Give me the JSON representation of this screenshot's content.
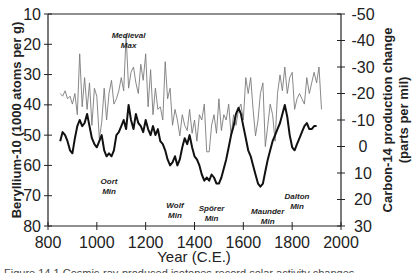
{
  "chart_data": {
    "type": "line",
    "title": "",
    "xlabel": "Year (C.E.)",
    "ylabel": "Beryllium-10 (1000 atoms per g)",
    "y2label_line1": "Carbon-14 production change",
    "y2label_line2": "(parts per mil)",
    "xlim": [
      800,
      2000
    ],
    "ylim": [
      80,
      10
    ],
    "y2lim": [
      30,
      -50
    ],
    "x_ticks": [
      800,
      1000,
      1200,
      1400,
      1600,
      1800,
      2000
    ],
    "y_ticks": [
      10,
      20,
      30,
      40,
      50,
      60,
      70,
      80
    ],
    "y2_ticks": [
      -50,
      -40,
      -30,
      -20,
      -10,
      0,
      10,
      20,
      30
    ],
    "grid": false,
    "legend": "none",
    "series": [
      {
        "name": "Beryllium-10",
        "axis": "left",
        "style": "thick black",
        "x": [
          850,
          860,
          870,
          880,
          890,
          900,
          910,
          920,
          930,
          940,
          950,
          960,
          970,
          980,
          990,
          1000,
          1010,
          1020,
          1030,
          1040,
          1050,
          1060,
          1070,
          1080,
          1090,
          1100,
          1110,
          1120,
          1130,
          1140,
          1150,
          1160,
          1170,
          1180,
          1190,
          1200,
          1210,
          1220,
          1230,
          1240,
          1250,
          1260,
          1270,
          1280,
          1290,
          1300,
          1310,
          1320,
          1330,
          1340,
          1350,
          1360,
          1370,
          1380,
          1390,
          1400,
          1410,
          1420,
          1430,
          1440,
          1450,
          1460,
          1470,
          1480,
          1490,
          1500,
          1510,
          1520,
          1530,
          1540,
          1550,
          1560,
          1570,
          1580,
          1590,
          1600,
          1610,
          1620,
          1630,
          1640,
          1650,
          1660,
          1670,
          1680,
          1690,
          1700,
          1710,
          1720,
          1730,
          1740,
          1750,
          1760,
          1770,
          1780,
          1790,
          1800,
          1810,
          1820,
          1830,
          1840,
          1850,
          1860,
          1870,
          1880,
          1890,
          1900
        ],
        "values": [
          52,
          49,
          50,
          52,
          55,
          56,
          51,
          47,
          45,
          47,
          46,
          43,
          47,
          51,
          53,
          54,
          52,
          50,
          55,
          57,
          56,
          57,
          55,
          50,
          49,
          47,
          45,
          48,
          40,
          45,
          48,
          43,
          46,
          47,
          49,
          45,
          48,
          50,
          47,
          50,
          48,
          52,
          53,
          55,
          58,
          60,
          59,
          57,
          60,
          58,
          54,
          51,
          53,
          50,
          54,
          57,
          58,
          60,
          63,
          65,
          64,
          65,
          63,
          64,
          66,
          66,
          64,
          61,
          58,
          54,
          50,
          47,
          43,
          41,
          43,
          47,
          51,
          55,
          57,
          60,
          63,
          66,
          67,
          66,
          62,
          58,
          55,
          52,
          50,
          48,
          46,
          43,
          40,
          44,
          50,
          54,
          55,
          53,
          51,
          49,
          47,
          46,
          48,
          48,
          47,
          47
        ]
      },
      {
        "name": "Carbon-14 production change",
        "axis": "right",
        "style": "thin gray",
        "x": [
          850,
          860,
          870,
          880,
          890,
          900,
          910,
          920,
          930,
          940,
          950,
          960,
          970,
          980,
          990,
          1000,
          1010,
          1020,
          1030,
          1040,
          1050,
          1060,
          1070,
          1080,
          1090,
          1100,
          1110,
          1120,
          1130,
          1140,
          1150,
          1160,
          1170,
          1180,
          1190,
          1200,
          1210,
          1220,
          1230,
          1240,
          1250,
          1260,
          1270,
          1280,
          1290,
          1300,
          1310,
          1320,
          1330,
          1340,
          1350,
          1360,
          1370,
          1380,
          1390,
          1400,
          1410,
          1420,
          1430,
          1440,
          1450,
          1460,
          1470,
          1480,
          1490,
          1500,
          1510,
          1520,
          1530,
          1540,
          1550,
          1560,
          1570,
          1580,
          1590,
          1600,
          1610,
          1620,
          1630,
          1640,
          1650,
          1660,
          1670,
          1680,
          1690,
          1700,
          1710,
          1720,
          1730,
          1740,
          1750,
          1760,
          1770,
          1780,
          1790,
          1800,
          1810,
          1820,
          1830,
          1840,
          1850,
          1860,
          1870,
          1880,
          1890,
          1900,
          1910,
          1920
        ],
        "values": [
          -20,
          -19,
          -21,
          -18,
          -19,
          -16,
          -20,
          -12,
          -35,
          -15,
          -26,
          -14,
          -24,
          -8,
          -22,
          -19,
          -3,
          -9,
          -22,
          -10,
          -20,
          -25,
          -16,
          -18,
          -21,
          -26,
          -21,
          -42,
          -22,
          -28,
          -30,
          -24,
          -20,
          -31,
          -25,
          -35,
          -15,
          -29,
          -12,
          -22,
          -14,
          -15,
          -10,
          -32,
          -18,
          -22,
          -8,
          -14,
          -10,
          -4,
          -12,
          -8,
          -6,
          -14,
          -5,
          -10,
          -2,
          -12,
          -10,
          -16,
          2,
          2,
          -8,
          -12,
          -5,
          -18,
          -6,
          -12,
          -10,
          -16,
          -4,
          -12,
          -8,
          -14,
          -16,
          -10,
          -26,
          -20,
          -26,
          -14,
          -4,
          -10,
          -20,
          -24,
          0,
          -8,
          -16,
          -12,
          -2,
          -20,
          -27,
          -21,
          -30,
          -20,
          -26,
          -28,
          -14,
          -18,
          -20,
          -18,
          -16,
          -26,
          -20,
          -24,
          -28,
          -24,
          -30,
          -14
        ]
      }
    ],
    "annotations": [
      {
        "line1": "Medieval",
        "line2": "Max",
        "x": 1130,
        "y": 18
      },
      {
        "line1": "Oort",
        "line2": "Min",
        "x": 1050,
        "y": 66
      },
      {
        "line1": "Wolf",
        "line2": "Min",
        "x": 1320,
        "y": 74
      },
      {
        "line1": "Spörer",
        "line2": "Min",
        "x": 1470,
        "y": 75
      },
      {
        "line1": "Maunder",
        "line2": "Min",
        "x": 1700,
        "y": 76
      },
      {
        "line1": "Dalton",
        "line2": "Min",
        "x": 1820,
        "y": 71
      }
    ]
  },
  "caption": "Figure 14.1  Cosmic-ray-produced isotopes record solar activity changes"
}
